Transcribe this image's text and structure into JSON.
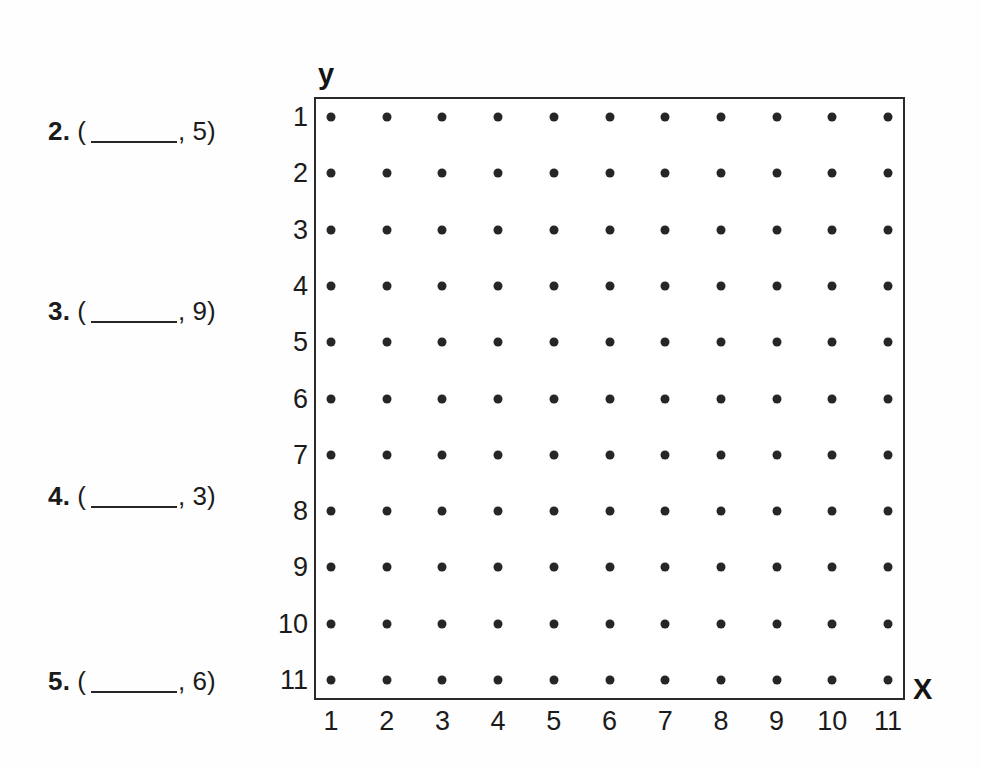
{
  "worksheet": {
    "questions": [
      {
        "number": "2.",
        "open_paren": "(",
        "blank": "",
        "separator": ",",
        "y_value": "5",
        "close_paren": ")",
        "top_px": 118
      },
      {
        "number": "3.",
        "open_paren": "(",
        "blank": "",
        "separator": ",",
        "y_value": "9",
        "close_paren": ")",
        "top_px": 298
      },
      {
        "number": "4.",
        "open_paren": "(",
        "blank": "",
        "separator": ",",
        "y_value": "3",
        "close_paren": ")",
        "top_px": 483
      },
      {
        "number": "5.",
        "open_paren": "(",
        "blank": "",
        "separator": ",",
        "y_value": "6",
        "close_paren": ")",
        "top_px": 668
      }
    ]
  },
  "grid": {
    "y_axis_name": "y",
    "x_axis_name": "X",
    "y_tick_labels": [
      "1",
      "2",
      "3",
      "4",
      "5",
      "6",
      "7",
      "8",
      "9",
      "10",
      "11"
    ],
    "x_tick_labels": [
      "1",
      "2",
      "3",
      "4",
      "5",
      "6",
      "7",
      "8",
      "9",
      "10",
      "11"
    ],
    "columns": 11,
    "rows": 11,
    "dot_color": "#262626",
    "border_color": "#2a2a2a",
    "background_color": "#ffffff"
  },
  "chart_data": {
    "type": "scatter",
    "title": "",
    "xlabel": "X",
    "ylabel": "y",
    "grid": false,
    "legend": "none",
    "x": [
      1,
      2,
      3,
      4,
      5,
      6,
      7,
      8,
      9,
      10,
      11
    ],
    "y": [
      1,
      2,
      3,
      4,
      5,
      6,
      7,
      8,
      9,
      10,
      11
    ],
    "xlim": [
      1,
      11
    ],
    "ylim": [
      1,
      11
    ],
    "y_axis_inverted": true,
    "xticklabels": [
      "1",
      "2",
      "3",
      "4",
      "5",
      "6",
      "7",
      "8",
      "9",
      "10",
      "11"
    ],
    "yticklabels": [
      "1",
      "2",
      "3",
      "4",
      "5",
      "6",
      "7",
      "8",
      "9",
      "10",
      "11"
    ],
    "note": "11 by 11 lattice of plot points; every (x, y) pair with x in 1..11 and y in 1..11 is marked with a dot"
  }
}
